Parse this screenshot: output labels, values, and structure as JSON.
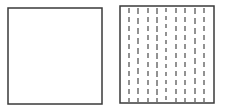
{
  "diagram": {
    "stroke_color": "#3a3a3a",
    "dash_color": "#3a3a3a",
    "left_square": {
      "label": "",
      "x": 8,
      "y": 8,
      "width": 94,
      "height": 96,
      "fill": "none"
    },
    "right_square": {
      "label": "",
      "x": 120,
      "y": 6,
      "width": 94,
      "height": 97,
      "vertical_dashed_lines": [
        {
          "x": 129,
          "dash": "5,4"
        },
        {
          "x": 138,
          "dash": "6,4"
        },
        {
          "x": 148,
          "dash": "5,4"
        },
        {
          "x": 157,
          "dash": "6,3"
        },
        {
          "x": 166,
          "dash": "4,4"
        },
        {
          "x": 176,
          "dash": "5,4"
        },
        {
          "x": 185,
          "dash": "5,4"
        },
        {
          "x": 195,
          "dash": "6,4"
        },
        {
          "x": 204,
          "dash": "5,4"
        }
      ]
    }
  }
}
